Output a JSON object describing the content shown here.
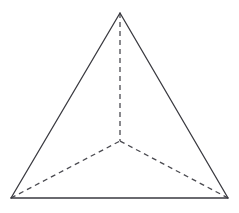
{
  "figure": {
    "name": "tetrahedron",
    "canvas": {
      "width": 239,
      "height": 213
    },
    "background_color": "#ffffff",
    "solid_edge_color": "#3a3a40",
    "hidden_edge_color": "#4a4a50",
    "solid_edge_width": 1.3,
    "hidden_edge_width": 1.3,
    "hidden_dash_pattern": "5,4",
    "vertices": {
      "apex": {
        "label": "apex",
        "x": 120,
        "y": 13
      },
      "base_front_left": {
        "label": "base-front-left",
        "x": 11,
        "y": 198
      },
      "base_front_right": {
        "label": "base-front-right",
        "x": 228,
        "y": 198
      },
      "base_back": {
        "label": "base-back",
        "x": 120,
        "y": 141
      }
    },
    "edges": [
      {
        "name": "edge-apex-to-front-left",
        "style": "solid",
        "from": "apex",
        "to": "base_front_left",
        "d": "M 120 13 L 11 198"
      },
      {
        "name": "edge-apex-to-front-right",
        "style": "solid",
        "from": "apex",
        "to": "base_front_right",
        "d": "M 120 13 L 228 198"
      },
      {
        "name": "edge-front-left-to-front-right",
        "style": "solid",
        "from": "base_front_left",
        "to": "base_front_right",
        "d": "M 11 198 L 228 198"
      },
      {
        "name": "edge-apex-to-back-hidden",
        "style": "dashed",
        "from": "apex",
        "to": "base_back",
        "d": "M 120 13 L 120 141"
      },
      {
        "name": "edge-front-left-to-back-hidden",
        "style": "dashed",
        "from": "base_front_left",
        "to": "base_back",
        "d": "M 11 198 L 120 141"
      },
      {
        "name": "edge-front-right-to-back-hidden",
        "style": "dashed",
        "from": "base_front_right",
        "to": "base_back",
        "d": "M 228 198 L 120 141"
      }
    ]
  }
}
